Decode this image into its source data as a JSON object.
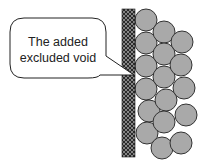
{
  "diagram": {
    "callout": {
      "lines": [
        "The added",
        "excluded void"
      ],
      "box": {
        "x": 10,
        "y": 18,
        "width": 96,
        "height": 60,
        "radius": 14
      },
      "pointer_tip": [
        134,
        75
      ],
      "text_color": "#222222",
      "stroke_color": "#222222",
      "fill_color": "#ffffff"
    },
    "wall": {
      "x": 122,
      "y": 9,
      "width": 13,
      "height": 148,
      "base_color": "#2a2a2a",
      "hatch_color": "#9a9a9a"
    },
    "particles": {
      "radius": 11,
      "fill_color": "#a9a9a9",
      "stroke_color": "#333333",
      "centers": [
        [
          146,
          20
        ],
        [
          146,
          43
        ],
        [
          146,
          66
        ],
        [
          146,
          89
        ],
        [
          149,
          111
        ],
        [
          147,
          133
        ],
        [
          164,
          32
        ],
        [
          164,
          54
        ],
        [
          164,
          77
        ],
        [
          166,
          100
        ],
        [
          164,
          122
        ],
        [
          162,
          148
        ],
        [
          182,
          42
        ],
        [
          181,
          65
        ],
        [
          184,
          88
        ],
        [
          186,
          115
        ],
        [
          181,
          143
        ]
      ]
    }
  }
}
